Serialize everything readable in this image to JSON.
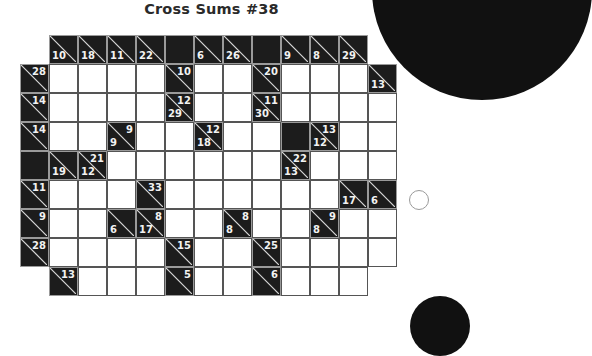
{
  "title": "Cross Sums #38",
  "puzzle": {
    "cell_size": 29,
    "origin_x": 20,
    "origin_y": 35,
    "rows": [
      [
        null,
        {
          "type": "clue",
          "down": "10"
        },
        {
          "type": "clue",
          "down": "18"
        },
        {
          "type": "clue",
          "down": "11"
        },
        {
          "type": "clue",
          "down": "22"
        },
        {
          "type": "block"
        },
        {
          "type": "clue",
          "down": "6"
        },
        {
          "type": "clue",
          "down": "26"
        },
        {
          "type": "block"
        },
        {
          "type": "clue",
          "down": "9"
        },
        {
          "type": "clue",
          "down": "8"
        },
        {
          "type": "clue",
          "down": "29"
        },
        null
      ],
      [
        {
          "type": "clue",
          "right": "28"
        },
        {
          "type": "white"
        },
        {
          "type": "white"
        },
        {
          "type": "white"
        },
        {
          "type": "white"
        },
        {
          "type": "clue",
          "right": "10"
        },
        {
          "type": "white"
        },
        {
          "type": "white"
        },
        {
          "type": "clue",
          "right": "20"
        },
        {
          "type": "white"
        },
        {
          "type": "white"
        },
        {
          "type": "white"
        },
        {
          "type": "clue",
          "down": "13"
        }
      ],
      [
        {
          "type": "clue",
          "right": "14"
        },
        {
          "type": "white"
        },
        {
          "type": "white"
        },
        {
          "type": "white"
        },
        {
          "type": "white"
        },
        {
          "type": "clue",
          "right": "12",
          "down": "29"
        },
        {
          "type": "white"
        },
        {
          "type": "white"
        },
        {
          "type": "clue",
          "right": "11",
          "down": "30"
        },
        {
          "type": "white"
        },
        {
          "type": "white"
        },
        {
          "type": "white"
        },
        {
          "type": "white"
        }
      ],
      [
        {
          "type": "clue",
          "right": "14"
        },
        {
          "type": "white"
        },
        {
          "type": "white"
        },
        {
          "type": "clue",
          "right": "9",
          "down": "9"
        },
        {
          "type": "white"
        },
        {
          "type": "white"
        },
        {
          "type": "clue",
          "right": "12",
          "down": "18"
        },
        {
          "type": "white"
        },
        {
          "type": "white"
        },
        {
          "type": "block"
        },
        {
          "type": "clue",
          "right": "13",
          "down": "12"
        },
        {
          "type": "white"
        },
        {
          "type": "white"
        }
      ],
      [
        {
          "type": "block"
        },
        {
          "type": "clue",
          "down": "19"
        },
        {
          "type": "clue",
          "right": "21",
          "down": "12"
        },
        {
          "type": "white"
        },
        {
          "type": "white"
        },
        {
          "type": "white"
        },
        {
          "type": "white"
        },
        {
          "type": "white"
        },
        {
          "type": "white"
        },
        {
          "type": "clue",
          "right": "22",
          "down": "13"
        },
        {
          "type": "white"
        },
        {
          "type": "white"
        },
        {
          "type": "white"
        }
      ],
      [
        {
          "type": "clue",
          "right": "11"
        },
        {
          "type": "white"
        },
        {
          "type": "white"
        },
        {
          "type": "white"
        },
        {
          "type": "clue",
          "right": "33"
        },
        {
          "type": "white"
        },
        {
          "type": "white"
        },
        {
          "type": "white"
        },
        {
          "type": "white"
        },
        {
          "type": "white"
        },
        {
          "type": "white"
        },
        {
          "type": "clue",
          "down": "17"
        },
        {
          "type": "clue",
          "down": "6"
        }
      ],
      [
        {
          "type": "clue",
          "right": "9"
        },
        {
          "type": "white"
        },
        {
          "type": "white"
        },
        {
          "type": "clue",
          "down": "6"
        },
        {
          "type": "clue",
          "right": "8",
          "down": "17"
        },
        {
          "type": "white"
        },
        {
          "type": "white"
        },
        {
          "type": "clue",
          "right": "8",
          "down": "8"
        },
        {
          "type": "white"
        },
        {
          "type": "white"
        },
        {
          "type": "clue",
          "right": "9",
          "down": "8"
        },
        {
          "type": "white"
        },
        {
          "type": "white"
        }
      ],
      [
        {
          "type": "clue",
          "right": "28"
        },
        {
          "type": "white"
        },
        {
          "type": "white"
        },
        {
          "type": "white"
        },
        {
          "type": "white"
        },
        {
          "type": "clue",
          "right": "15"
        },
        {
          "type": "white"
        },
        {
          "type": "white"
        },
        {
          "type": "clue",
          "right": "25"
        },
        {
          "type": "white"
        },
        {
          "type": "white"
        },
        {
          "type": "white"
        },
        {
          "type": "white"
        }
      ],
      [
        null,
        {
          "type": "clue",
          "right": "13"
        },
        {
          "type": "white"
        },
        {
          "type": "white"
        },
        {
          "type": "white"
        },
        {
          "type": "clue",
          "right": "5"
        },
        {
          "type": "white"
        },
        {
          "type": "white"
        },
        {
          "type": "clue",
          "right": "6"
        },
        {
          "type": "white"
        },
        {
          "type": "white"
        },
        {
          "type": "white"
        },
        null
      ]
    ]
  },
  "colors": {
    "clue_fill": "#1c1c1c",
    "clue_text": "#f2f2f2",
    "grid_line": "#555555",
    "title_text": "#2a2a2a"
  }
}
